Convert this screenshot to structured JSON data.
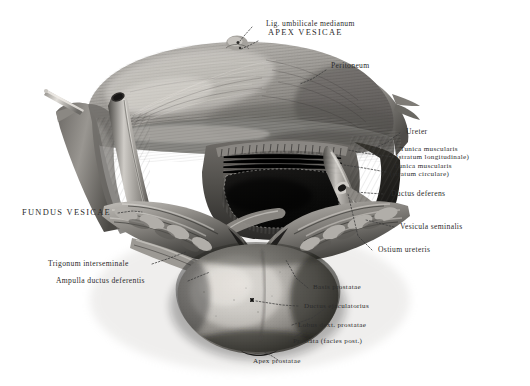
{
  "plate": {
    "title": "Vesica urinaria et prostata (facies posterior)",
    "medium": "halftone engraving, grayscale",
    "background_color": "#ffffff",
    "ink_color": "#2b2b2b"
  },
  "labels": {
    "lig_umbilicale": "Lig. umbilicale medianum",
    "apex_vesicae": "APEX VESICAE",
    "peritoneum": "Peritoneum",
    "ureter": "Ureter",
    "tunica_long_1": "Tunica muscularis",
    "tunica_long_2": "(stratum longitudinale)",
    "tunica_circ_1": "Tunica muscularis",
    "tunica_circ_2": "(stratum circulare)",
    "ductus_deferens": "Ductus deferens",
    "vesicula_seminalis": "Vesicula seminalis",
    "ostium_ureteris": "Ostium ureteris",
    "fundus_vesicae": "FUNDUS VESICAE",
    "trigonum": "Trigonum interseminale",
    "ampulla": "Ampulla ductus deferentis",
    "basis_prostatae": "Basis prostatae",
    "ductus_ejaculatorius": "Ductus ejaculatorius",
    "lobus_dext": "Lobus dext. prostatae",
    "prostata_facies": "Prostata (facies post.)",
    "apex_prostatae": "Apex prostatae"
  },
  "structures": [
    {
      "name": "peritoneum-flap",
      "region": "upper"
    },
    {
      "name": "bladder-dome",
      "region": "upper-center"
    },
    {
      "name": "muscular-window",
      "region": "center"
    },
    {
      "name": "ureter-left",
      "region": "left"
    },
    {
      "name": "ureter-right",
      "region": "right"
    },
    {
      "name": "vesicula-seminalis-left",
      "region": "lower-left"
    },
    {
      "name": "vesicula-seminalis-right",
      "region": "lower-right"
    },
    {
      "name": "ampulla-ductus-deferentis",
      "region": "lower-left"
    },
    {
      "name": "prostate-body",
      "region": "bottom-center"
    },
    {
      "name": "probe-instrument",
      "region": "upper-left"
    }
  ]
}
